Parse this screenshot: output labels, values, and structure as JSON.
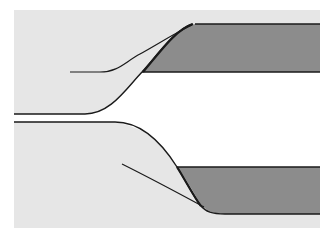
{
  "diagram": {
    "type": "cross-section schematic",
    "colors": {
      "page_background": "#ffffff",
      "field": "#e6e6e6",
      "channel": "#ffffff",
      "band_fill": "#8c8c8c",
      "stroke": "#1a1a1a"
    },
    "elements": [
      {
        "name": "background-field",
        "shape": "rect",
        "x": 14,
        "y": 10,
        "w": 306,
        "h": 218
      },
      {
        "name": "upper-band",
        "shape": "tapered band",
        "top_y": 24,
        "bottom_y": 72,
        "right_x": 320
      },
      {
        "name": "lower-band",
        "shape": "tapered band",
        "top_y": 167,
        "bottom_y": 214,
        "right_x": 320
      },
      {
        "name": "channel",
        "shape": "flared opening",
        "left_upper_y": 114,
        "left_lower_y": 122
      },
      {
        "name": "upper-guide-line",
        "shape": "curve",
        "from": [
          70,
          72
        ],
        "to": [
          192,
          25
        ]
      },
      {
        "name": "lower-guide-line",
        "shape": "curve",
        "from": [
          122,
          164
        ],
        "to": [
          204,
          207
        ]
      }
    ]
  }
}
